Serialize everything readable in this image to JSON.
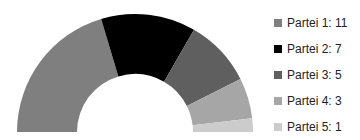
{
  "chart_data": {
    "type": "pie",
    "variant": "half-donut",
    "title": "",
    "categories": [
      "Partei 1",
      "Partei 2",
      "Partei 3",
      "Partei 4",
      "Partei 5"
    ],
    "values": [
      11,
      7,
      5,
      3,
      1
    ],
    "colors": [
      "#7f7f7f",
      "#000000",
      "#5f5f5f",
      "#a6a6a6",
      "#cccccc"
    ],
    "legend_labels": [
      "Partei 1:  11",
      "Partei 2:  7",
      "Partei 3:  5",
      "Partei 4:  3",
      "Partei 5:  1"
    ],
    "legend_position": "right"
  }
}
